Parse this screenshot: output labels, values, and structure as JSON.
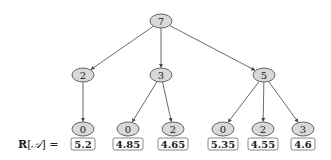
{
  "diagram": {
    "type": "tree",
    "node_fill": "#d9d9d9",
    "stroke": "#444444",
    "root": {
      "id": "n0",
      "label": "7",
      "x": 161,
      "y": 21
    },
    "level1": [
      {
        "id": "n1",
        "label": "2",
        "x": 83,
        "y": 75,
        "parent": "n0"
      },
      {
        "id": "n2",
        "label": "3",
        "x": 161,
        "y": 75,
        "parent": "n0"
      },
      {
        "id": "n3",
        "label": "5",
        "x": 264,
        "y": 75,
        "parent": "n0"
      }
    ],
    "leaves": [
      {
        "id": "l0",
        "label": "0",
        "x": 83,
        "y": 129,
        "parent": "n1",
        "value": "5.2"
      },
      {
        "id": "l1",
        "label": "0",
        "x": 128,
        "y": 129,
        "parent": "n2",
        "value": "4.85"
      },
      {
        "id": "l2",
        "label": "2",
        "x": 173,
        "y": 129,
        "parent": "n2",
        "value": "4.65"
      },
      {
        "id": "l3",
        "label": "0",
        "x": 223,
        "y": 129,
        "parent": "n3",
        "value": "5.35"
      },
      {
        "id": "l4",
        "label": "2",
        "x": 263,
        "y": 129,
        "parent": "n3",
        "value": "4.55"
      },
      {
        "id": "l5",
        "label": "3",
        "x": 303,
        "y": 129,
        "parent": "n3",
        "value": "4.6"
      }
    ],
    "values_row_label": {
      "prefix": "R[",
      "symbol": "𝒜",
      "suffix": "] ="
    },
    "values_row_y": 144
  }
}
